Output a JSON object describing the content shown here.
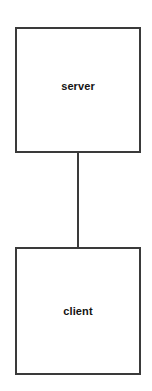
{
  "diagram": {
    "background_color": "#ffffff",
    "stroke_color": "#3a3a3a",
    "text_color": "#131313",
    "nodes": [
      {
        "id": "server",
        "label": "server",
        "shape": "rectangle",
        "x": 15,
        "y": 27,
        "width": 126,
        "height": 126
      },
      {
        "id": "client",
        "label": "client",
        "shape": "rectangle",
        "x": 15,
        "y": 247,
        "width": 126,
        "height": 128
      }
    ],
    "edges": [
      {
        "id": "server-client",
        "from": "server",
        "to": "client",
        "label": "",
        "style": "solid",
        "arrowhead": "none"
      }
    ]
  }
}
